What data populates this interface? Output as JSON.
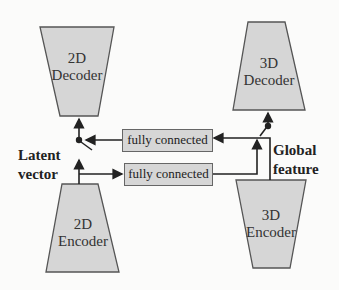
{
  "blocks": {
    "decoder_2d": {
      "line1": "2D",
      "line2": "Decoder"
    },
    "decoder_3d": {
      "line1": "3D",
      "line2": "Decoder"
    },
    "encoder_2d": {
      "line1": "2D",
      "line2": "Encoder"
    },
    "encoder_3d": {
      "line1": "3D",
      "line2": "Encoder"
    }
  },
  "fc_layers": [
    {
      "label": "fully connected"
    },
    {
      "label": "fully connected"
    }
  ],
  "labels": {
    "latent_line1": "Latent",
    "latent_line2": "vector",
    "global_line1": "Global",
    "global_line2": "feature"
  },
  "colors": {
    "block_fill": "#d6d6d6",
    "stroke": "#555555",
    "arrow": "#222222"
  }
}
